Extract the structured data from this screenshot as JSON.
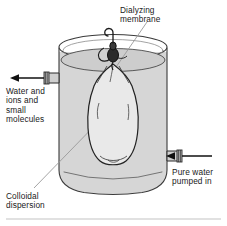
{
  "figure": {
    "width": 227,
    "height": 226,
    "background": "#ffffff"
  },
  "labels": {
    "dialyzing_membrane": "Dialyzing\nmembrane",
    "water_ions_small_molecules": "Water and\nions and\nsmall\nmolecules",
    "colloidal_dispersion": "Colloidal\ndispersion",
    "pure_water_pumped_in": "Pure water\npumped in"
  },
  "parts": {
    "beaker": "beaker-vessel",
    "water": "water-fill",
    "water_surface": "water-surface-ellipse",
    "bag": "dialysis-bag",
    "knot": "bag-knot-tie",
    "hook": "suspension-hook",
    "outlet_tube": "left-outlet-tube",
    "inlet_tube": "right-inlet-tube",
    "outlet_arrow": "outflow-arrow-left",
    "inlet_arrow": "inflow-arrow-left",
    "leader_membrane": "leader-line-membrane",
    "leader_colloidal": "leader-line-colloidal",
    "baseline_rule": "bottom-divider-rule"
  },
  "colors": {
    "ink": "#1a1a1a",
    "outline": "#3a3a3a",
    "water_fill": "#d6d6d6",
    "water_surface": "#c9c9c9",
    "bag_fill": "#e9e9e9",
    "glass_edge": "#8c8c8c",
    "leader": "#9a9a9a",
    "rule": "#c4c4c4",
    "background": "#ffffff"
  }
}
